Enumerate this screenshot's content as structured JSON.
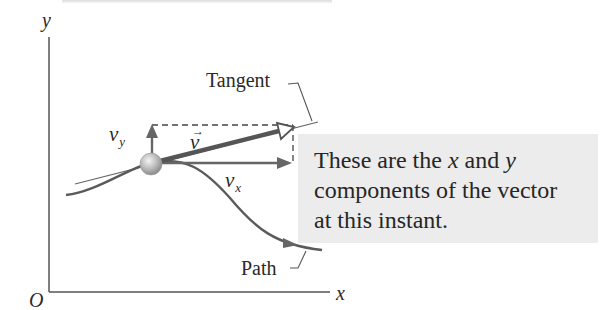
{
  "figure": {
    "axes": {
      "y_label": "y",
      "x_label": "x",
      "origin_label": "O"
    },
    "labels": {
      "tangent": "Tangent",
      "path": "Path",
      "v_vector": "v",
      "v_vector_arrow": "→",
      "vy_main": "v",
      "vy_sub": "y",
      "vx_main": "v",
      "vx_sub": "x"
    },
    "callout": {
      "line1_a": "These are the ",
      "line1_x": "x",
      "line1_b": " and ",
      "line1_y": "y",
      "line2": "components of the vector",
      "line3": "at this instant."
    },
    "colors": {
      "line": "#555555",
      "vector": "#5a5a5a",
      "callout_bg": "#ececec",
      "particle": "#b8b8b8"
    }
  }
}
